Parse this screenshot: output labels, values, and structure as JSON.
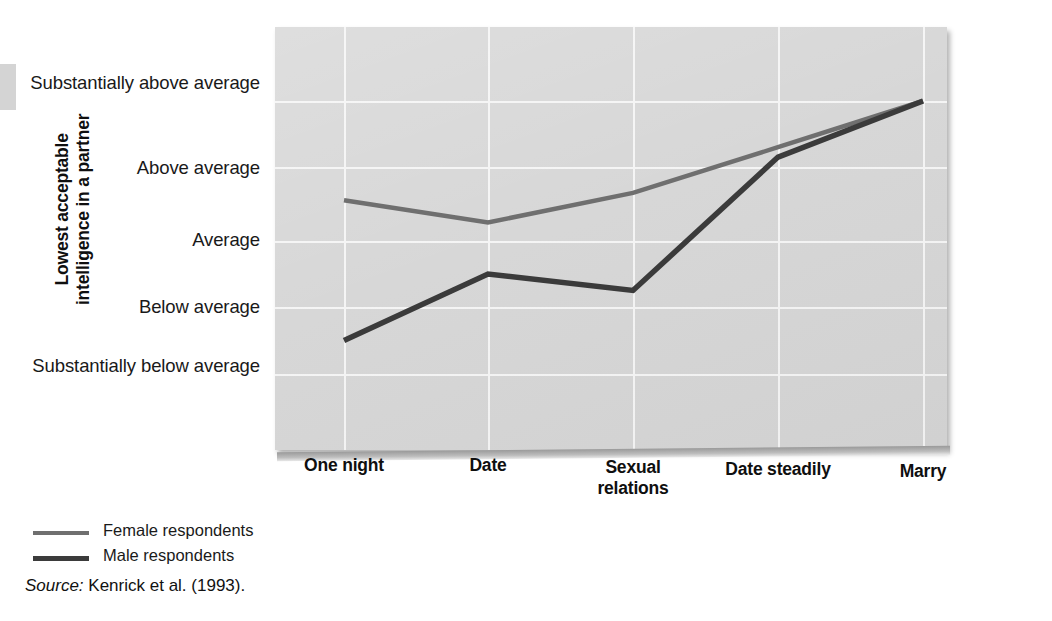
{
  "figure": {
    "y_axis_title": "Lowest acceptable intelligence in a partner",
    "source_word": "Source:",
    "source_text": " Kenrick et al. (1993)."
  },
  "legend": {
    "items": [
      {
        "label": "Female respondents",
        "color": "#6f6f6f",
        "width": 4
      },
      {
        "label": "Male respondents",
        "color": "#3b3b3b",
        "width": 5
      }
    ]
  },
  "chart_data": {
    "type": "line",
    "title": "",
    "xlabel": "",
    "ylabel": "Lowest acceptable intelligence in a partner",
    "categories": [
      "One night",
      "Date",
      "Sexual relations",
      "Date steadily",
      "Marry"
    ],
    "ytick_labels": [
      "Substantially above average",
      "Above average",
      "Average",
      "Below average",
      "Substantially below average"
    ],
    "ytick_values": [
      5,
      4,
      3,
      2,
      1
    ],
    "ylim": [
      0.45,
      5.55
    ],
    "grid": true,
    "legend_position": "below-left",
    "series": [
      {
        "name": "Female respondents",
        "color": "#6f6f6f",
        "values": [
          3.55,
          3.25,
          3.65,
          4.3,
          5.0
        ]
      },
      {
        "name": "Male respondents",
        "color": "#3b3b3b",
        "values": [
          1.5,
          2.5,
          2.25,
          4.15,
          5.0
        ]
      }
    ]
  }
}
